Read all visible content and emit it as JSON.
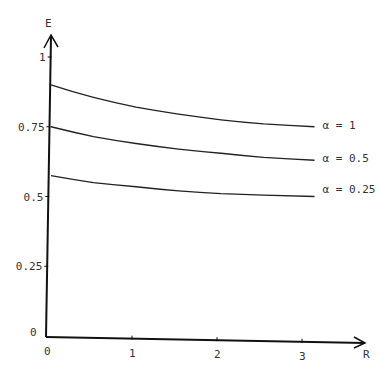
{
  "chart_data": {
    "type": "line",
    "title": "",
    "xlabel": "R",
    "ylabel": "E",
    "xlim": [
      0,
      3.5
    ],
    "ylim": [
      0,
      1.1
    ],
    "x_ticks": [
      "0",
      "1",
      "2",
      "3"
    ],
    "y_ticks": [
      "0",
      "0.25",
      "0.5",
      "0.75",
      "1"
    ],
    "grid": false,
    "legend_position": "inline-right",
    "series": [
      {
        "name": "α = 1",
        "x": [
          0,
          0.5,
          1,
          1.5,
          2,
          2.5,
          3.1
        ],
        "values": [
          0.9,
          0.855,
          0.82,
          0.795,
          0.775,
          0.76,
          0.75
        ]
      },
      {
        "name": "α = 0.5",
        "x": [
          0,
          0.5,
          1,
          1.5,
          2,
          2.5,
          3.1
        ],
        "values": [
          0.75,
          0.715,
          0.69,
          0.67,
          0.655,
          0.64,
          0.63
        ]
      },
      {
        "name": "α = 0.25",
        "x": [
          0,
          0.5,
          1,
          1.5,
          2,
          2.5,
          3.1
        ],
        "values": [
          0.575,
          0.55,
          0.535,
          0.52,
          0.51,
          0.505,
          0.5
        ]
      }
    ]
  }
}
